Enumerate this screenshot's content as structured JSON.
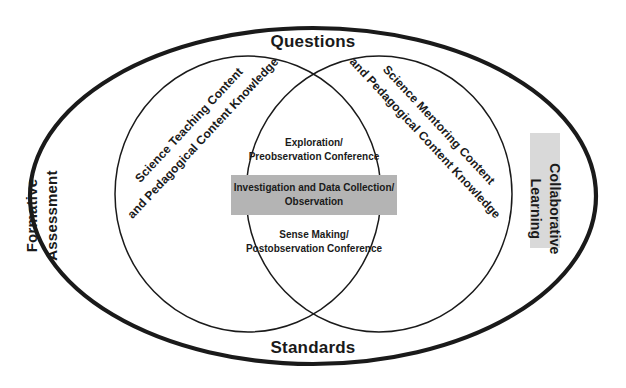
{
  "diagram": {
    "type": "venn",
    "title_top": "Questions",
    "title_bottom": "Standards",
    "outer_ring": {
      "top_label": "Questions",
      "bottom_label": "Standards",
      "left_label": "Formative\nAssessment",
      "left_label_line1": "Formative",
      "left_label_line2": "Assessment",
      "right_label_line1": "Collaborative",
      "right_label_line2": "Learning"
    },
    "left_circle": {
      "line1": "Science Teaching Content",
      "line2": "and Pedagogical Content Knowledge"
    },
    "right_circle": {
      "line1": "Science Mentoring Content",
      "line2": "and Pedagogical Content Knowledge"
    },
    "intersection": {
      "phases": [
        {
          "line1": "Exploration/",
          "line2": "Preobservation Conference",
          "highlighted": false
        },
        {
          "line1": "Investigation and Data Collection/",
          "line2": "Observation",
          "highlighted": true
        },
        {
          "line1": "Sense Making/",
          "line2": "Postobservation Conference",
          "highlighted": false
        }
      ]
    },
    "colors": {
      "stroke": "#1a1a1a",
      "background": "#ffffff",
      "highlight_gray": "#b4b4b4",
      "panel_gray": "#d9d9d9",
      "text": "#1a1a1a"
    }
  }
}
